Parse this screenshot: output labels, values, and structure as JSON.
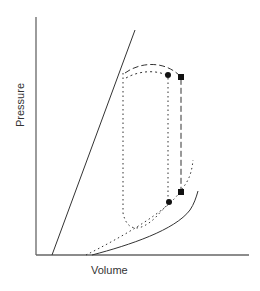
{
  "diagram": {
    "type": "pressure-volume diagram",
    "x_axis_label": "Volume",
    "y_axis_label": "Pressure",
    "colors": {
      "axis": "#666666",
      "line": "#333333",
      "marker": "#111111",
      "background": "#ffffff"
    },
    "elements": [
      {
        "name": "steep-solid-line",
        "style": "solid",
        "description": "steep linear line rising from lower left"
      },
      {
        "name": "dashed-loop",
        "style": "dashed",
        "description": "loop from top-left across top to square marker, then vertical down to lower square"
      },
      {
        "name": "dotted-loop",
        "style": "dotted",
        "description": "loop from top-left down left side, along bottom, up to circle markers"
      },
      {
        "name": "dotted-curve",
        "style": "dotted",
        "description": "curve rising from x-axis toward upper right"
      },
      {
        "name": "solid-curve",
        "style": "solid",
        "description": "concave-up curve rising from x-axis to lower right"
      }
    ],
    "markers": [
      {
        "shape": "circle",
        "position": "top"
      },
      {
        "shape": "square",
        "position": "top"
      },
      {
        "shape": "circle",
        "position": "bottom"
      },
      {
        "shape": "square",
        "position": "bottom"
      }
    ]
  }
}
